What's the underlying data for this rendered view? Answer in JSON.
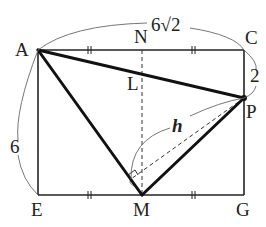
{
  "figure": {
    "type": "geometry",
    "colors": {
      "line": "#222222",
      "thin": "#555555",
      "background": "#ffffff"
    },
    "points": {
      "A": {
        "label": "A",
        "x": 38,
        "y": 50
      },
      "N": {
        "label": "N",
        "x": 142,
        "y": 50
      },
      "C": {
        "label": "C",
        "x": 244,
        "y": 50
      },
      "L": {
        "label": "L",
        "x": 142,
        "y": 72
      },
      "P": {
        "label": "P",
        "x": 244,
        "y": 98
      },
      "E": {
        "label": "E",
        "x": 38,
        "y": 195
      },
      "M": {
        "label": "M",
        "x": 142,
        "y": 195
      },
      "G": {
        "label": "G",
        "x": 244,
        "y": 195
      },
      "H": {
        "label": "",
        "x": 131,
        "y": 179
      }
    },
    "measurements": {
      "AC": "6√2",
      "AE": "6",
      "CP": "2",
      "height": "h"
    },
    "tick_marks": "||"
  }
}
